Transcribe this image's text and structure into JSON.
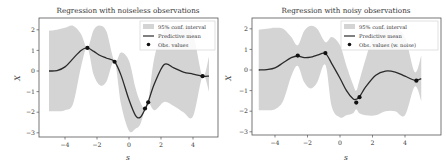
{
  "chart_data": [
    {
      "type": "line",
      "title": "Regression with noiseless observations",
      "xlabel": "s",
      "ylabel": "X",
      "xlim": [
        -5.5,
        5.5
      ],
      "ylim": [
        -3.2,
        2.6
      ],
      "xticks": [
        -4,
        -2,
        0,
        2,
        4
      ],
      "yticks": [
        2,
        1,
        0,
        -1,
        -2,
        -3
      ],
      "xtick_labels": [
        "−4",
        "−2",
        "0",
        "2",
        "4"
      ],
      "ytick_labels": [
        "2",
        "1",
        "0",
        "−1",
        "−2",
        "−3"
      ],
      "grid": false,
      "legend_position": "upper right",
      "legend": [
        "95% conf. interval",
        "Predictive mean",
        "Obs. values"
      ],
      "series": [
        {
          "name": "Predictive mean",
          "x": [
            -5,
            -4.5,
            -4,
            -3.5,
            -3,
            -2.6,
            -2.2,
            -1.8,
            -1.4,
            -0.9,
            -0.5,
            0,
            0.4,
            0.7,
            1.0,
            1.2,
            1.6,
            2.2,
            2.8,
            3.4,
            4.0,
            4.6,
            5.0
          ],
          "y": [
            0.0,
            0.02,
            0.2,
            0.6,
            1.0,
            1.12,
            0.95,
            0.75,
            0.62,
            0.45,
            -0.2,
            -1.4,
            -2.15,
            -2.25,
            -1.85,
            -1.5,
            -0.6,
            0.32,
            0.15,
            -0.05,
            -0.15,
            -0.25,
            -0.25
          ]
        },
        {
          "name": "95% conf. interval",
          "x": [
            -5,
            -4.5,
            -4,
            -3.5,
            -3,
            -2.6,
            -2.2,
            -1.8,
            -1.4,
            -0.9,
            -0.5,
            0,
            0.4,
            0.7,
            1.0,
            1.2,
            1.6,
            2.2,
            2.8,
            3.4,
            4.0,
            4.6,
            5.0
          ],
          "upper": [
            1.95,
            2.0,
            2.1,
            2.2,
            1.8,
            1.12,
            2.0,
            2.2,
            1.9,
            0.45,
            0.9,
            0.5,
            -0.8,
            -1.5,
            -1.85,
            -1.5,
            0.7,
            2.0,
            2.2,
            2.2,
            1.8,
            -0.25,
            0.7
          ],
          "lower": [
            -1.95,
            -1.95,
            -1.9,
            -1.6,
            0.2,
            1.12,
            -0.2,
            -0.7,
            -0.5,
            0.45,
            -1.6,
            -2.9,
            -2.8,
            -2.6,
            -1.85,
            -1.5,
            -1.9,
            -1.5,
            -1.7,
            -2.0,
            -2.2,
            -0.25,
            -1.0
          ]
        },
        {
          "name": "Obs. values",
          "x": [
            -2.6,
            -0.9,
            1.0,
            1.2,
            4.6
          ],
          "y": [
            1.12,
            0.45,
            -1.82,
            -1.52,
            -0.25
          ]
        }
      ]
    },
    {
      "type": "line",
      "title": "Regression with noisy observations",
      "xlabel": "s",
      "ylabel": "X",
      "xlim": [
        -5.5,
        5.5
      ],
      "ylim": [
        -3.2,
        2.6
      ],
      "xticks": [
        -4,
        -2,
        0,
        2,
        4
      ],
      "yticks": [
        2,
        1,
        0,
        -1,
        -2,
        -3
      ],
      "xtick_labels": [
        "−4",
        "−2",
        "0",
        "2",
        "4"
      ],
      "ytick_labels": [
        "2",
        "1",
        "0",
        "−1",
        "−2",
        "−3"
      ],
      "grid": false,
      "legend_position": "upper right",
      "legend": [
        "95% conf. interval",
        "Predictive mean",
        "Obs. values (w. noise)"
      ],
      "series": [
        {
          "name": "Predictive mean",
          "x": [
            -5,
            -4.5,
            -4,
            -3.5,
            -3,
            -2.6,
            -2.2,
            -1.8,
            -1.4,
            -0.9,
            -0.5,
            0,
            0.4,
            0.8,
            1.0,
            1.2,
            1.6,
            2.2,
            2.8,
            3.4,
            4.0,
            4.6,
            5.0
          ],
          "y": [
            0.0,
            0.02,
            0.1,
            0.35,
            0.6,
            0.68,
            0.6,
            0.62,
            0.72,
            0.8,
            0.3,
            -0.4,
            -1.0,
            -1.4,
            -1.42,
            -1.3,
            -0.8,
            -0.25,
            -0.05,
            -0.1,
            -0.3,
            -0.5,
            -0.42
          ]
        },
        {
          "name": "95% conf. interval",
          "x": [
            -5,
            -4.5,
            -4,
            -3.5,
            -3,
            -2.6,
            -2.2,
            -1.8,
            -1.4,
            -0.9,
            -0.5,
            0,
            0.4,
            0.8,
            1.0,
            1.2,
            1.6,
            2.2,
            2.8,
            3.4,
            4.0,
            4.6,
            5.0
          ],
          "upper": [
            1.95,
            2.0,
            2.05,
            2.0,
            1.6,
            1.2,
            1.9,
            2.15,
            2.0,
            1.35,
            1.6,
            1.2,
            0.2,
            -0.7,
            -1.0,
            -0.5,
            0.6,
            1.95,
            2.1,
            2.0,
            1.6,
            -0.1,
            0.7
          ],
          "lower": [
            -1.95,
            -1.95,
            -1.9,
            -1.5,
            -0.3,
            0.2,
            -0.6,
            -0.9,
            -0.6,
            0.25,
            -1.8,
            -2.3,
            -2.2,
            -2.1,
            -1.9,
            -2.1,
            -2.2,
            -2.2,
            -2.0,
            -2.0,
            -2.2,
            -0.8,
            -1.5
          ]
        },
        {
          "name": "Obs. values (w. noise)",
          "x": [
            -2.6,
            -0.9,
            1.0,
            1.2,
            4.7
          ],
          "y": [
            0.7,
            0.82,
            -1.58,
            -1.32,
            -0.52
          ]
        }
      ]
    }
  ],
  "figure": {
    "left": {
      "title": "Regression with noiseless observations",
      "xlabel": "s",
      "ylabel": "X",
      "legend": {
        "band": "95% conf. interval",
        "mean": "Predictive mean",
        "obs": "Obs. values"
      }
    },
    "right": {
      "title": "Regression with noisy observations",
      "xlabel": "s",
      "ylabel": "X",
      "legend": {
        "band": "95% conf. interval",
        "mean": "Predictive mean",
        "obs": "Obs. values (w. noise)"
      }
    },
    "colors": {
      "band": "#d4d4d4",
      "mean": "#2a2a2a",
      "obs": "#111111",
      "axis": "#555555"
    }
  }
}
